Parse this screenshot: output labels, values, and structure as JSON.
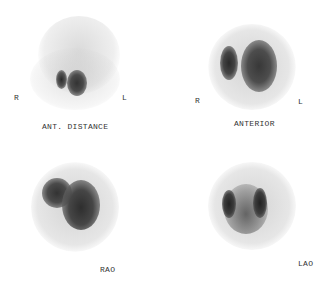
{
  "figure": {
    "views": [
      {
        "name": "ant-distance",
        "caption": "ANT. DISTANCE",
        "left_marker": "R",
        "right_marker": "L"
      },
      {
        "name": "anterior",
        "caption": "ANTERIOR",
        "left_marker": "R",
        "right_marker": "L"
      },
      {
        "name": "rao",
        "caption": "RAO"
      },
      {
        "name": "lao",
        "caption": "LAO"
      }
    ]
  }
}
